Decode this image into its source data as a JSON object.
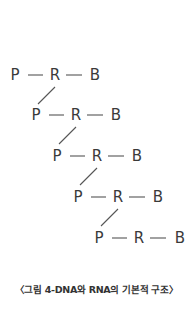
{
  "diagram": {
    "rows": [
      {
        "p": "P",
        "r": "R",
        "b": "B"
      },
      {
        "p": "P",
        "r": "R",
        "b": "B"
      },
      {
        "p": "P",
        "r": "R",
        "b": "B"
      },
      {
        "p": "P",
        "r": "R",
        "b": "B"
      },
      {
        "p": "P",
        "r": "R",
        "b": "B"
      }
    ],
    "caption": "〈그림 4-DNA와 RNA의 기본적 구조〉"
  },
  "colors": {
    "text": "#3a3a3a",
    "line": "#555555",
    "background": "#ffffff"
  }
}
